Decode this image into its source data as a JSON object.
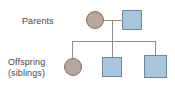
{
  "diagram": {
    "type": "pedigree-family-tree",
    "title": "",
    "labels": {
      "parents": "Parents",
      "offspring_line1": "Offspring",
      "offspring_line2": "(siblings)"
    },
    "colors": {
      "female_fill": "#b6a69c",
      "female_stroke": "#7d6f68",
      "male_fill": "#a9c6dd",
      "male_stroke": "#6e88a0",
      "connector": "#8c8c8c",
      "text": "#4a4a4a",
      "background": "#ffffff"
    },
    "generations": [
      {
        "name": "parents",
        "label": "Parents",
        "members": [
          {
            "id": "parent-mother",
            "sex": "female",
            "shape": "circle",
            "affected": false
          },
          {
            "id": "parent-father",
            "sex": "male",
            "shape": "square",
            "affected": false
          }
        ]
      },
      {
        "name": "offspring",
        "label": "Offspring (siblings)",
        "members": [
          {
            "id": "child-1",
            "sex": "female",
            "shape": "circle",
            "affected": false
          },
          {
            "id": "child-2",
            "sex": "male",
            "shape": "square",
            "affected": false
          },
          {
            "id": "child-3",
            "sex": "male",
            "shape": "square",
            "affected": false
          }
        ]
      }
    ],
    "connectors": [
      {
        "id": "line-couple",
        "kind": "mating-line",
        "orientation": "horizontal"
      },
      {
        "id": "line-descent",
        "kind": "descent-line",
        "orientation": "vertical"
      },
      {
        "id": "line-sibship",
        "kind": "sibship-line",
        "orientation": "horizontal"
      },
      {
        "id": "line-drop-1",
        "kind": "child-line",
        "orientation": "vertical"
      },
      {
        "id": "line-drop-2",
        "kind": "child-line",
        "orientation": "vertical"
      },
      {
        "id": "line-drop-3",
        "kind": "child-line",
        "orientation": "vertical"
      }
    ]
  }
}
